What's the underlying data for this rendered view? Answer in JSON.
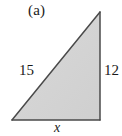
{
  "figure": {
    "panel_label": "(a)",
    "shape_name": "right-triangle",
    "fill_color": "#d5d5d5",
    "stroke_color": "#4a4a4a",
    "background_color": "#ffffff",
    "text_color": "#1a1a1a",
    "vertices": {
      "bottom_left": [
        12,
        120
      ],
      "bottom_right": [
        100,
        120
      ],
      "top_right": [
        100,
        12
      ]
    },
    "labels": {
      "hypotenuse": "15",
      "vertical_leg": "12",
      "base": "x"
    }
  },
  "chart_data": {
    "type": "diagram",
    "title": "(a)",
    "shape": "right triangle",
    "edges": [
      {
        "name": "hypotenuse",
        "label": "15",
        "value": 15,
        "from": "bottom_left",
        "to": "top_right",
        "label_position": "left-of-hypotenuse"
      },
      {
        "name": "vertical_leg",
        "label": "12",
        "value": 12,
        "from": "top_right",
        "to": "bottom_right",
        "label_position": "right-of-vertical-leg"
      },
      {
        "name": "base",
        "label": "x",
        "value": null,
        "from": "bottom_left",
        "to": "bottom_right",
        "label_position": "below-base"
      }
    ],
    "right_angle_vertex": "bottom_right",
    "annotations": [
      "(a)",
      "15",
      "12",
      "x"
    ]
  }
}
